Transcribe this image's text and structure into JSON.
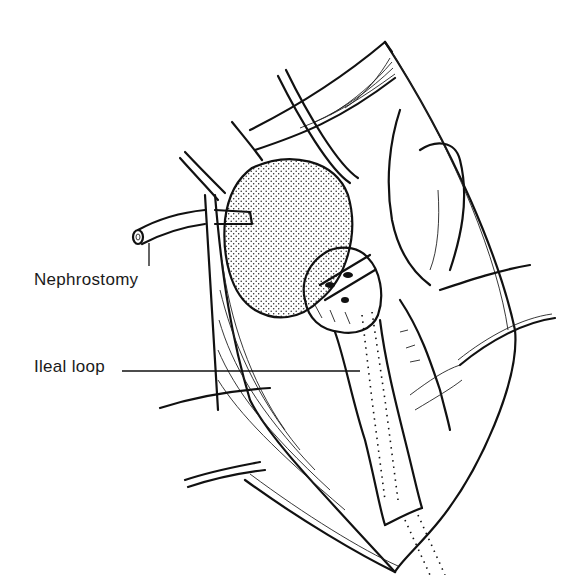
{
  "figure": {
    "labels": {
      "nephrostomy": "Nephrostomy",
      "ileal_loop": "Ileal loop"
    },
    "colors": {
      "ink": "#111111",
      "background": "#ffffff"
    }
  }
}
